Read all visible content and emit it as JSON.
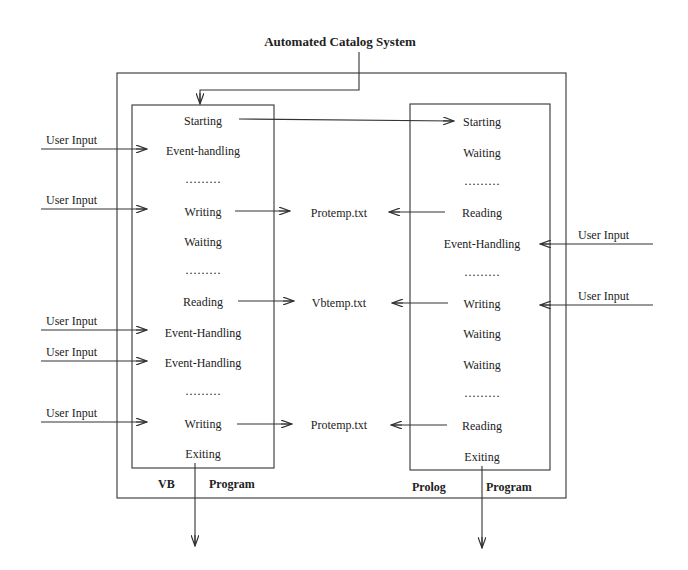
{
  "title": "Automated Catalog System",
  "outer_box": {
    "x": 117,
    "y": 73,
    "w": 449,
    "h": 425
  },
  "vb_program": {
    "label_left": "VB",
    "label_right": "Program",
    "box": {
      "x": 132,
      "y": 105,
      "w": 142,
      "h": 363
    },
    "states": [
      {
        "label": "Starting",
        "y": 121
      },
      {
        "label": "Event-handling",
        "y": 151
      },
      {
        "label": "·········",
        "y": 182
      },
      {
        "label": "Writing",
        "y": 212
      },
      {
        "label": "Waiting",
        "y": 242
      },
      {
        "label": "·········",
        "y": 273
      },
      {
        "label": "Reading",
        "y": 302
      },
      {
        "label": "Event-Handling",
        "y": 333
      },
      {
        "label": "Event-Handling",
        "y": 363
      },
      {
        "label": "·········",
        "y": 394
      },
      {
        "label": "Writing",
        "y": 424
      },
      {
        "label": "Exiting",
        "y": 454
      }
    ]
  },
  "prolog_program": {
    "label_left": "Prolog",
    "label_right": "Program",
    "box": {
      "x": 410,
      "y": 104,
      "w": 140,
      "h": 366
    },
    "states": [
      {
        "label": "Starting",
        "y": 122
      },
      {
        "label": "Waiting",
        "y": 153
      },
      {
        "label": "·········",
        "y": 184
      },
      {
        "label": "Reading",
        "y": 213
      },
      {
        "label": "Event-Handling",
        "y": 244
      },
      {
        "label": "·········",
        "y": 275
      },
      {
        "label": "Writing",
        "y": 304
      },
      {
        "label": "Waiting",
        "y": 334
      },
      {
        "label": "Waiting",
        "y": 365
      },
      {
        "label": "·········",
        "y": 396
      },
      {
        "label": "Reading",
        "y": 426
      },
      {
        "label": "Exiting",
        "y": 457
      }
    ]
  },
  "files": [
    {
      "label": "Protemp.txt",
      "y": 213
    },
    {
      "label": "Vbtemp.txt",
      "y": 303
    },
    {
      "label": "Protemp.txt",
      "y": 425
    }
  ],
  "user_inputs_left": [
    {
      "label": "User Input",
      "y": 149
    },
    {
      "label": "User Input",
      "y": 209
    },
    {
      "label": "User Input",
      "y": 330
    },
    {
      "label": "User Input",
      "y": 361
    },
    {
      "label": "User Input",
      "y": 422
    }
  ],
  "user_inputs_right": [
    {
      "label": "User Input",
      "y": 244
    },
    {
      "label": "User Input",
      "y": 305
    }
  ]
}
